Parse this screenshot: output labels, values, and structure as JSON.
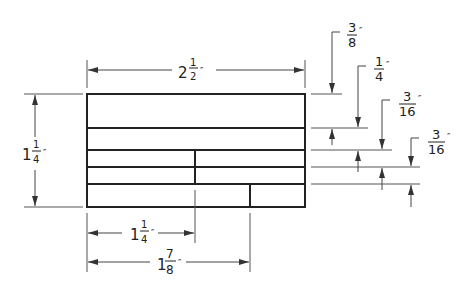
{
  "drawing": {
    "type": "dimensioned technical drawing",
    "units": "inches",
    "overall_width": {
      "whole": "2",
      "num": "1",
      "den": "2",
      "mark": "″"
    },
    "overall_height": {
      "whole": "1",
      "num": "1",
      "den": "4",
      "mark": "″"
    },
    "bottom_dims": [
      {
        "whole": "1",
        "num": "1",
        "den": "4",
        "mark": "″"
      },
      {
        "whole": "1",
        "num": "7",
        "den": "8",
        "mark": "″"
      }
    ],
    "right_dims": [
      {
        "num": "3",
        "den": "8",
        "mark": "″"
      },
      {
        "num": "1",
        "den": "4",
        "mark": "″"
      },
      {
        "num": "3",
        "den": "16",
        "mark": "″"
      },
      {
        "num": "3",
        "den": "16",
        "mark": "″"
      }
    ]
  },
  "colors": {
    "line": "#222222",
    "dim": "#555555",
    "background": "#ffffff"
  }
}
